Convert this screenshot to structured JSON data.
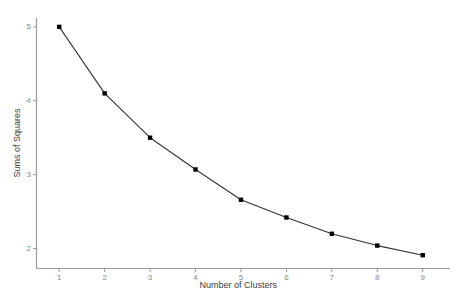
{
  "chart_data": {
    "type": "line",
    "title": "",
    "subtitle": "",
    "xlabel": "Number of Clusters",
    "ylabel": "Sums of Squares",
    "x": [
      1,
      2,
      3,
      4,
      5,
      6,
      7,
      8,
      9
    ],
    "values": [
      5.0,
      4.1,
      3.5,
      3.07,
      2.66,
      2.42,
      2.2,
      2.04,
      1.91
    ],
    "series": [
      {
        "name": "Sums of Squares",
        "values": [
          5.0,
          4.1,
          3.5,
          3.07,
          2.66,
          2.42,
          2.2,
          2.04,
          1.91
        ]
      }
    ],
    "xtick_labels": [
      "1",
      "2",
      "3",
      "4",
      "5",
      "6",
      "7",
      "8",
      "9"
    ],
    "xticks": [
      1,
      2,
      3,
      4,
      5,
      6,
      7,
      8,
      9
    ],
    "ytick_labels": [
      "2",
      "3",
      "4",
      "5"
    ],
    "yticks": [
      2,
      3,
      4,
      5
    ],
    "xlim": [
      0.5,
      9.6
    ],
    "ylim": [
      1.73,
      5.12
    ],
    "grid": false,
    "legend": false,
    "legend_position": "none",
    "marker": "square",
    "line_color": "#333333",
    "marker_color": "#000000",
    "axis_color": "#9a9a9a",
    "tick_label_color": "#8a8a8a",
    "axis_title_color": "#3c3c3c",
    "background_color": "#ffffff"
  }
}
